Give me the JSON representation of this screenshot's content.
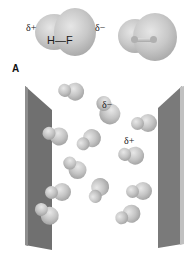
{
  "panel_a": {
    "label": "A",
    "molecule_label": "H—F",
    "delta_plus": "δ+",
    "delta_minus": "δ−"
  },
  "panel_b": {
    "delta_minus": "δ−",
    "delta_plus": "δ+",
    "molecules": [
      {
        "x": 70,
        "y": 92,
        "angle": 10
      },
      {
        "x": 106,
        "y": 108,
        "angle": 60,
        "labeled": true
      },
      {
        "x": 143,
        "y": 124,
        "angle": 0
      },
      {
        "x": 54,
        "y": 136,
        "angle": 20
      },
      {
        "x": 88,
        "y": 141,
        "angle": -30
      },
      {
        "x": 130,
        "y": 156,
        "angle": 10
      },
      {
        "x": 73,
        "y": 168,
        "angle": 45
      },
      {
        "x": 57,
        "y": 193,
        "angle": 0
      },
      {
        "x": 98,
        "y": 191,
        "angle": -60
      },
      {
        "x": 138,
        "y": 192,
        "angle": 0
      },
      {
        "x": 45,
        "y": 214,
        "angle": 40
      },
      {
        "x": 127,
        "y": 216,
        "angle": -20
      }
    ]
  },
  "colors": {
    "plate": "#6f6f6f",
    "plate_edge": "#b8b8b8",
    "sphere": "#c4c4c4"
  }
}
